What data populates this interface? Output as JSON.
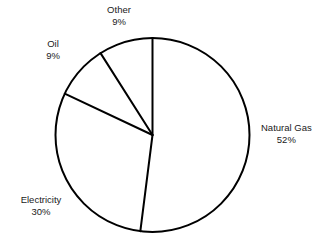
{
  "chart_data": {
    "type": "pie",
    "title": "",
    "categories": [
      "Natural Gas",
      "Electricity",
      "Oil",
      "Other"
    ],
    "values": [
      52,
      30,
      9,
      9
    ],
    "value_unit": "%",
    "labels": [
      {
        "name": "Natural Gas",
        "value": "52%",
        "percent": 52
      },
      {
        "name": "Electricity",
        "value": "30%",
        "percent": 30
      },
      {
        "name": "Oil",
        "value": "9%",
        "percent": 9
      },
      {
        "name": "Other",
        "value": "9%",
        "percent": 9
      }
    ],
    "legend": "none",
    "legend_position": "outside-labels",
    "grid": false,
    "start_angle_deg": 0,
    "direction": "clockwise",
    "slice_boundaries_deg": [
      0,
      187.2,
      295.2,
      327.6,
      360
    ],
    "style": {
      "fill": "#ffffff",
      "stroke": "#000000",
      "stroke_width": 2,
      "background": "#ffffff",
      "text_color": "#1a1a1a"
    },
    "geometry": {
      "center_x": 152.5,
      "center_y": 135,
      "radius": 97
    }
  }
}
